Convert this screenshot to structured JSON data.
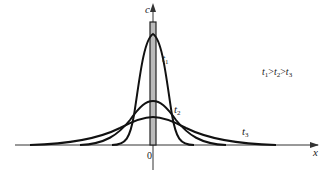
{
  "diagram": {
    "type": "diffusion-concentration-profiles",
    "axes": {
      "y_label": "c",
      "x_label": "x",
      "origin_label": "0"
    },
    "curves": [
      {
        "name": "t1",
        "label": "t",
        "sub": "1",
        "description": "tall narrow peak"
      },
      {
        "name": "t2",
        "label": "t",
        "sub": "2",
        "description": "medium peak"
      },
      {
        "name": "t3",
        "label": "t",
        "sub": "3",
        "description": "low wide peak"
      }
    ],
    "initial_source": "narrow rectangular pulse at x = 0",
    "annotation": {
      "t": "t",
      "s1": "1",
      "gt1": ">",
      "s2": "2",
      "gt2": ">",
      "s3": "3",
      "text": "t1>t2>t3"
    },
    "colors": {
      "line": "#111111",
      "axis": "#333333",
      "pulse_fill": "#bbbbbb"
    }
  }
}
